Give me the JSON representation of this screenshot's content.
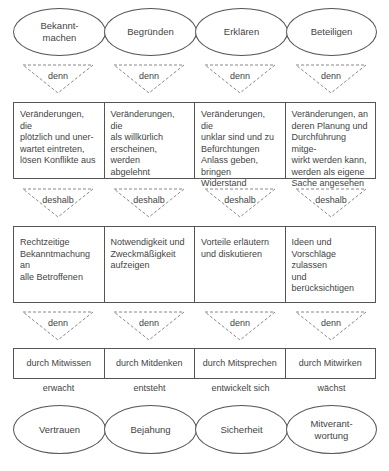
{
  "top_ovals": [
    "Bekannt-\nmachen",
    "Begründen",
    "Erklären",
    "Beteiligen"
  ],
  "connector_1": [
    "denn",
    "denn",
    "denn",
    "denn"
  ],
  "row_consequences": [
    "Veränderungen, die\nplötzlich und uner-\nwartet eintreten,\nlösen Konflikte aus",
    "Veränderungen, die\nals willkürlich\nerscheinen, werden\nabgelehnt",
    "Veränderungen, die\nunklar sind und zu\nBefürchtungen\nAnlass geben,\nbringen Widerstand",
    "Veränderungen, an\nderen Planung und\nDurchführung mitge-\nwirkt werden kann,\nwerden als eigene\nSache angesehen"
  ],
  "connector_2": [
    "deshalb",
    "deshalb",
    "deshalb",
    "deshalb"
  ],
  "row_actions": [
    "Rechtzeitige\nBekanntmachung an\nalle Betroffenen",
    "Notwendigkeit und\nZweckmäßigkeit\naufzeigen",
    "Vorteile erläutern\nund diskutieren",
    "Ideen und\nVorschläge zulassen\nund berücksichtigen"
  ],
  "connector_3": [
    "denn",
    "denn",
    "denn",
    "denn"
  ],
  "row_means": [
    "durch Mitwissen",
    "durch Mitdenken",
    "durch Mitsprechen",
    "durch Mitwirken"
  ],
  "verbs": [
    "erwacht",
    "entsteht",
    "entwickelt sich",
    "wächst"
  ],
  "bottom_ovals": [
    "Vertrauen",
    "Bejahung",
    "Sicherheit",
    "Mitverant-\nwortung"
  ],
  "colors": {
    "line": "#555555",
    "dashed": "#888888",
    "text": "#444444",
    "background": "#ffffff"
  }
}
